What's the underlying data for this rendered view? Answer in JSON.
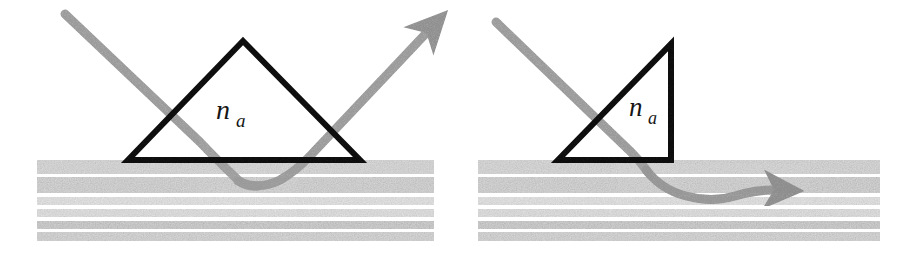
{
  "figure": {
    "kind": "optical-coupling-diagram",
    "background_color": "#ffffff",
    "width": 903,
    "height": 254,
    "panel_count": 2
  },
  "colors": {
    "prism_stroke": "#111111",
    "ray": "#9a9a9a",
    "ray_dark": "#8a8a8a",
    "stripe_light": "#d2d2d2",
    "stripe_mid": "#c0c0c0",
    "stripe_dark": "#b4b4b4",
    "substrate_gap": "#f4f4f4",
    "label": "#151515"
  },
  "panels": [
    {
      "id": "left-panel",
      "name": "prism-coupler-reflected",
      "prism": {
        "name": "equilateral-prism",
        "shape": "triangle",
        "label_base": "n",
        "label_subscript": "a",
        "label_full": "n_a",
        "apex": [
          243,
          41
        ],
        "base_left": [
          128,
          160
        ],
        "base_right": [
          360,
          160
        ],
        "stroke_width": 6
      },
      "substrate": {
        "name": "layered-waveguide-substrate",
        "x": 37,
        "y": 160,
        "width": 397,
        "height": 80,
        "layers": [
          {
            "y": 160,
            "h": 14,
            "tone": "stripe_mid"
          },
          {
            "y": 176,
            "h": 16,
            "tone": "stripe_mid"
          },
          {
            "y": 196,
            "h": 9,
            "tone": "stripe_light"
          },
          {
            "y": 209,
            "h": 9,
            "tone": "stripe_light"
          },
          {
            "y": 221,
            "h": 8,
            "tone": "stripe_dark"
          },
          {
            "y": 232,
            "h": 9,
            "tone": "stripe_mid"
          }
        ]
      },
      "rays": [
        {
          "name": "incident-ray",
          "from": [
            65,
            14
          ],
          "to": [
            245,
            185
          ],
          "arrow": false,
          "style": "straight-then-curved"
        },
        {
          "name": "evanescent-coupling-curve",
          "from": [
            245,
            185
          ],
          "to": [
            440,
            20
          ],
          "arrow": true,
          "style": "curved-bounce"
        }
      ],
      "arrow_tip": [
        440,
        20
      ]
    },
    {
      "id": "right-panel",
      "name": "prism-coupler-guided",
      "prism": {
        "name": "right-angle-prism",
        "shape": "right-triangle",
        "label_base": "n",
        "label_subscript": "a",
        "label_full": "n_a",
        "apex": [
          671,
          44
        ],
        "base_left": [
          558,
          160
        ],
        "base_right": [
          671,
          160
        ],
        "stroke_width": 6
      },
      "substrate": {
        "name": "layered-waveguide-substrate",
        "x": 478,
        "y": 160,
        "width": 402,
        "height": 80,
        "layers": [
          {
            "y": 160,
            "h": 14,
            "tone": "stripe_mid"
          },
          {
            "y": 176,
            "h": 16,
            "tone": "stripe_mid"
          },
          {
            "y": 196,
            "h": 9,
            "tone": "stripe_light"
          },
          {
            "y": 209,
            "h": 9,
            "tone": "stripe_light"
          },
          {
            "y": 221,
            "h": 8,
            "tone": "stripe_dark"
          },
          {
            "y": 232,
            "h": 9,
            "tone": "stripe_mid"
          }
        ]
      },
      "rays": [
        {
          "name": "incident-ray",
          "from": [
            495,
            22
          ],
          "to": [
            640,
            160
          ],
          "arrow": false,
          "style": "straight"
        },
        {
          "name": "guided-wave-ray",
          "from": [
            640,
            160
          ],
          "to": [
            808,
            190
          ],
          "arrow": true,
          "style": "sinuous"
        }
      ],
      "arrow_tip": [
        808,
        190
      ]
    }
  ]
}
